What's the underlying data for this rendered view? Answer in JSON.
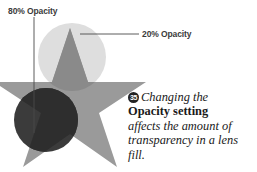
{
  "figure": {
    "background_color": "#ffffff",
    "width": 257,
    "height": 172
  },
  "callouts": [
    {
      "id": "opacity-80",
      "label": "80% Opacity",
      "leader": "vertical line from label down to dark circle"
    },
    {
      "id": "opacity-20",
      "label": "20% Opacity",
      "leader": "horizontal line from label left to light circle"
    }
  ],
  "caption": {
    "badge": "35",
    "line_1_italic": "Changing the",
    "line_2_bold": "Opacity setting",
    "line_3_italic": "affects the amount of",
    "line_4_italic": "transparency in a lens",
    "line_5_italic": "fill."
  },
  "artwork": {
    "description": "Five-pointed gray star with two overlapping translucent lens-fill circles",
    "shapes": [
      {
        "name": "star",
        "type": "star",
        "points": 5,
        "fill": "#9a9a9a"
      },
      {
        "name": "lens-circle-20",
        "type": "circle",
        "opacity_label": "20% Opacity",
        "fill": "#dedede",
        "overlap_fill": "#8a8a8a"
      },
      {
        "name": "lens-circle-80",
        "type": "circle",
        "opacity_label": "80% Opacity",
        "fill": "#3b3b3b",
        "overlap_fill": "#2e2e2e"
      }
    ],
    "colors": {
      "star": "#9a9a9a",
      "light_circle": "#dedede",
      "dark_circle": "#3b3b3b",
      "leader_line": "#4a4a4a",
      "text": "#3b3b3b"
    }
  }
}
